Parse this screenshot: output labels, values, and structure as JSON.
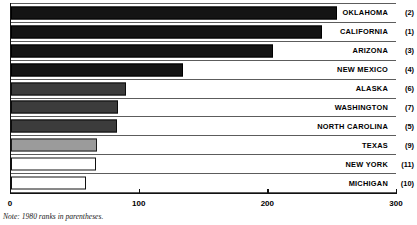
{
  "chart_data": {
    "type": "bar",
    "orientation": "horizontal",
    "title": "",
    "xlabel": "",
    "ylabel": "",
    "xlim": [
      0,
      300
    ],
    "ticks": [
      0,
      100,
      200,
      300
    ],
    "tick_labels": [
      "0",
      "100",
      "200",
      "300"
    ],
    "grid": false,
    "legend": "none",
    "note": "Note: 1980 ranks in parentheses.",
    "categories": [
      "OKLAHOMA",
      "CALIFORNIA",
      "ARIZONA",
      "NEW MEXICO",
      "ALASKA",
      "WASHINGTON",
      "NORTH CAROLINA",
      "TEXAS",
      "NEW YORK",
      "MICHIGAN"
    ],
    "values": [
      253,
      242,
      204,
      134,
      89,
      83,
      82,
      67,
      66,
      58
    ],
    "rank_labels": [
      "(2)",
      "(1)",
      "(3)",
      "(4)",
      "(6)",
      "(7)",
      "(5)",
      "(9)",
      "(11)",
      "(10)"
    ],
    "bars": [
      {
        "name": "OKLAHOMA",
        "value": 253,
        "rank": "(2)",
        "style": "dk"
      },
      {
        "name": "CALIFORNIA",
        "value": 242,
        "rank": "(1)",
        "style": "dk"
      },
      {
        "name": "ARIZONA",
        "value": 204,
        "rank": "(3)",
        "style": "dk"
      },
      {
        "name": "NEW MEXICO",
        "value": 134,
        "rank": "(4)",
        "style": "dk"
      },
      {
        "name": "ALASKA",
        "value": 89,
        "rank": "(6)",
        "style": "dg"
      },
      {
        "name": "WASHINGTON",
        "value": 83,
        "rank": "(7)",
        "style": "dg"
      },
      {
        "name": "NORTH CAROLINA",
        "value": 82,
        "rank": "(5)",
        "style": "dg"
      },
      {
        "name": "TEXAS",
        "value": 67,
        "rank": "(9)",
        "style": "mg"
      },
      {
        "name": "NEW YORK",
        "value": 66,
        "rank": "(11)",
        "style": "wh"
      },
      {
        "name": "MICHIGAN",
        "value": 58,
        "rank": "(10)",
        "style": "wh"
      }
    ],
    "colors": {
      "dark": "#141414",
      "dark_gray": "#3c3c3c",
      "medium_gray": "#9b9b9b",
      "white": "#ffffff",
      "axis": "#111111",
      "rule": "#5c5c5c"
    }
  }
}
